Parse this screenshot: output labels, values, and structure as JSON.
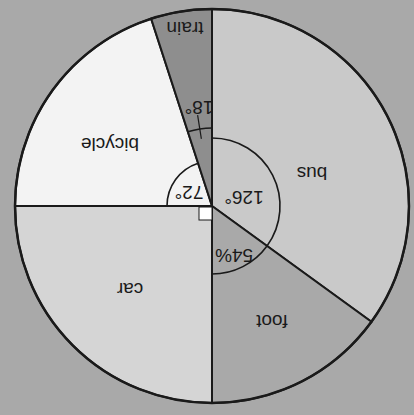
{
  "chart_data": {
    "type": "pie",
    "title": "",
    "orientation": "rotated 180 degrees (upside down)",
    "units": "degrees",
    "categories": [
      "bus",
      "foot",
      "car",
      "bicycle",
      "train"
    ],
    "values": [
      126,
      54,
      90,
      72,
      18
    ],
    "angle_labels": [
      "126°",
      "54%",
      "",
      "72°",
      "18°"
    ],
    "right_angle_marker_on": "car",
    "colors": {
      "bus": "#c9c9c9",
      "foot": "#a9a9a9",
      "car": "#d5d5d5",
      "bicycle": "#f3f3f3",
      "train": "#8e8e8e"
    },
    "legend": "none (labels inside slices)"
  },
  "labels": {
    "bus": "bus",
    "foot": "foot",
    "car": "car",
    "bicycle": "bicycle",
    "train": "train",
    "angle_bus": "126°",
    "angle_foot": "54%",
    "angle_bicycle": "72°",
    "angle_train": "18°"
  },
  "colors": {
    "background": "#a9a9a9",
    "outline": "#1a1a1a"
  }
}
